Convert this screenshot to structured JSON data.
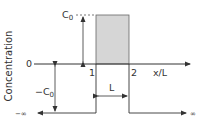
{
  "diagram": {
    "y_axis_label": "Concentration",
    "x_axis_label": "x/L",
    "top_level_label": "C",
    "top_level_sub": "0",
    "zero_label": "0",
    "neg_level_label": "−C",
    "neg_level_sub": "0",
    "tick_1": "1",
    "tick_2": "2",
    "width_label": "L",
    "left_infinity": "−∞",
    "right_infinity": "∞",
    "colors": {
      "line": "#333333",
      "shade_fill": "#d6d6d6",
      "shade_stroke": "#555555"
    }
  }
}
